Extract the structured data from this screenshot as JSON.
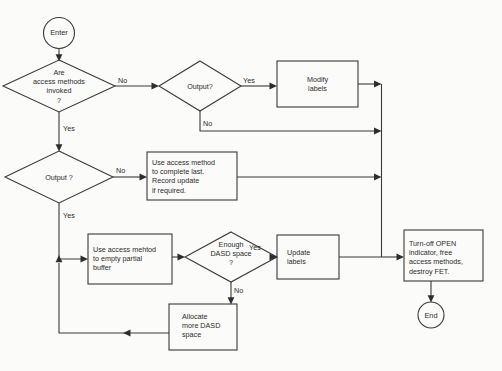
{
  "diagram": {
    "background_color": "#fbfbf9",
    "line_color": "#3a3a3a",
    "text_color": "#2b2b2b"
  },
  "nodes": {
    "enter": {
      "label": "Enter",
      "type": "terminator"
    },
    "access_methods": {
      "label": "Are\naccess methods\ninvoked\n?",
      "type": "decision"
    },
    "output_top": {
      "label": "Output?",
      "type": "decision"
    },
    "modify_labels": {
      "label": "Modify\nlabels",
      "type": "process"
    },
    "output_left": {
      "label": "Output ?",
      "type": "decision"
    },
    "complete_last": {
      "label": "Use access  method\nto complete last.\nRecord update\nif required.",
      "type": "process"
    },
    "empty_partial": {
      "label": "Use access mehtod\nto empty partial\nbuffer",
      "type": "process"
    },
    "dasd_space": {
      "label": "Enough\nDASD space\n?",
      "type": "decision"
    },
    "update_labels": {
      "label": "Update\nlabels",
      "type": "process"
    },
    "allocate_dasd": {
      "label": "Allocate\nmore DASD\nspace",
      "type": "process"
    },
    "turn_off_open": {
      "label": "Turn-off OPEN\nindicator, free\naccess methods,\ndestroy FET.",
      "type": "process"
    },
    "end": {
      "label": "End",
      "type": "terminator"
    }
  },
  "edge_labels": {
    "access_no": "No",
    "access_yes": "Yes",
    "output_top_yes": "Yes",
    "output_top_no": "No",
    "output_left_no": "No",
    "output_left_yes": "Yes",
    "dasd_yes": "Yes",
    "dasd_no": "No"
  }
}
